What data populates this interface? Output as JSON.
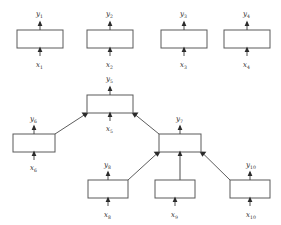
{
  "diagram": {
    "colors": {
      "background": "#ffffff",
      "box_stroke": "#5a5a5a",
      "box_fill": "#ffffff",
      "connector": "#3a3a3a",
      "label_text": "#2b2b2b"
    },
    "blocks": [
      {
        "id": "b1",
        "name": "block-1",
        "input_label": "x",
        "input_sub": "1",
        "output_label": "y",
        "output_sub": "1",
        "x": 17,
        "y": 30,
        "w": 46,
        "h": 18
      },
      {
        "id": "b2",
        "name": "block-2",
        "input_label": "x",
        "input_sub": "2",
        "output_label": "y",
        "output_sub": "2",
        "x": 87,
        "y": 30,
        "w": 46,
        "h": 18
      },
      {
        "id": "b3",
        "name": "block-3",
        "input_label": "x",
        "input_sub": "3",
        "output_label": "y",
        "output_sub": "3",
        "x": 161,
        "y": 30,
        "w": 46,
        "h": 18
      },
      {
        "id": "b4",
        "name": "block-4",
        "input_label": "x",
        "input_sub": "4",
        "output_label": "y",
        "output_sub": "4",
        "x": 224,
        "y": 30,
        "w": 46,
        "h": 18
      },
      {
        "id": "b5",
        "name": "composite-block-5",
        "input_label": "x",
        "input_sub": "5",
        "output_label": "y",
        "output_sub": "5",
        "x": 87,
        "y": 95,
        "w": 46,
        "h": 18
      },
      {
        "id": "b6",
        "name": "block-6",
        "input_label": "x",
        "input_sub": "6",
        "output_label": "y",
        "output_sub": "6",
        "x": 13,
        "y": 134,
        "w": 42,
        "h": 18
      },
      {
        "id": "b7",
        "name": "composite-block-7",
        "input_label": "x",
        "input_sub": "7",
        "output_label": "y",
        "output_sub": "7",
        "x": 159,
        "y": 134,
        "w": 42,
        "h": 18
      },
      {
        "id": "b8",
        "name": "block-8",
        "input_label": "x",
        "input_sub": "8",
        "output_label": "y",
        "output_sub": "8",
        "x": 88,
        "y": 180,
        "w": 40,
        "h": 18
      },
      {
        "id": "b9",
        "name": "block-9",
        "input_label": "x",
        "input_sub": "9",
        "output_label": "y",
        "output_sub": "9",
        "x": 155,
        "y": 180,
        "w": 40,
        "h": 18
      },
      {
        "id": "b10",
        "name": "block-10",
        "input_label": "x",
        "input_sub": "10",
        "output_label": "y",
        "output_sub": "10",
        "x": 230,
        "y": 180,
        "w": 40,
        "h": 18
      }
    ],
    "visible_labels": {
      "row_top": [
        "y1",
        "x1",
        "y2",
        "x2",
        "y3",
        "x3",
        "y4",
        "x4"
      ],
      "row_middle": [
        "y5",
        "x5",
        "y6",
        "x6",
        "y7",
        "x7"
      ],
      "row_bottom": [
        "y8",
        "x8",
        "y9",
        "x9",
        "y10",
        "x10"
      ]
    },
    "connections": [
      {
        "from": "b6",
        "to": "b5",
        "name": "edge-b6-to-b5",
        "type": "diagonal"
      },
      {
        "from": "b7",
        "to": "b5",
        "name": "edge-b7-to-b5",
        "type": "diagonal"
      },
      {
        "from": "b8",
        "to": "b7",
        "name": "edge-b8-to-b7",
        "type": "diagonal"
      },
      {
        "from": "b9",
        "to": "b7",
        "name": "edge-b9-to-b7",
        "type": "vertical"
      },
      {
        "from": "b10",
        "to": "b7",
        "name": "edge-b10-to-b7",
        "type": "diagonal"
      }
    ]
  }
}
